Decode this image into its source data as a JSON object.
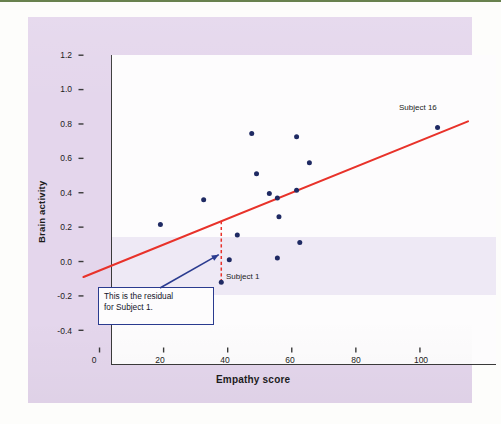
{
  "figure": {
    "background_color": "#e4d6ec",
    "plot_background_color": "#fdfcfd",
    "point_color": "#1f2a63",
    "line_color": "#e8322a",
    "annotation_color": "#2a3b8f"
  },
  "chart_data": {
    "type": "scatter",
    "title": "",
    "xlabel": "Empathy score",
    "ylabel": "Brain activity",
    "xlim": [
      -5,
      115
    ],
    "ylim": [
      -0.5,
      1.3
    ],
    "xticks": [
      0,
      20,
      40,
      60,
      80,
      100
    ],
    "yticks": [
      -0.4,
      -0.2,
      0.0,
      0.2,
      0.4,
      0.6,
      0.8,
      1.0,
      1.2
    ],
    "xtick_labels": [
      "0",
      "20",
      "40",
      "60",
      "80",
      "100"
    ],
    "ytick_labels": [
      "1.2",
      "1.0",
      "0.8",
      "0.6",
      "0.4",
      "0.2",
      "0.0",
      "-0.2",
      "-0.4"
    ],
    "grid": false,
    "legend": null,
    "points": [
      {
        "x": 38,
        "y": -0.12,
        "label": "Subject 1"
      },
      {
        "x": 19,
        "y": 0.215,
        "label": ""
      },
      {
        "x": 32.5,
        "y": 0.36,
        "label": ""
      },
      {
        "x": 40.5,
        "y": 0.01,
        "label": ""
      },
      {
        "x": 43,
        "y": 0.155,
        "label": ""
      },
      {
        "x": 47.5,
        "y": 0.745,
        "label": ""
      },
      {
        "x": 49,
        "y": 0.51,
        "label": ""
      },
      {
        "x": 53,
        "y": 0.395,
        "label": ""
      },
      {
        "x": 55.5,
        "y": 0.37,
        "label": ""
      },
      {
        "x": 55.5,
        "y": 0.02,
        "label": ""
      },
      {
        "x": 56,
        "y": 0.26,
        "label": ""
      },
      {
        "x": 61.5,
        "y": 0.415,
        "label": ""
      },
      {
        "x": 61.5,
        "y": 0.725,
        "label": ""
      },
      {
        "x": 62.5,
        "y": 0.11,
        "label": ""
      },
      {
        "x": 65.5,
        "y": 0.575,
        "label": ""
      },
      {
        "x": 105.5,
        "y": 0.78,
        "label": "Subject 16"
      }
    ],
    "regression_line": {
      "style": "solid",
      "color": "#e8322a",
      "x_start": -5,
      "y_start": -0.09,
      "x_end": 115,
      "y_end": 0.815
    },
    "residual_segment": {
      "style": "dashed",
      "color": "#e8322a",
      "x": 38,
      "y_top": 0.235,
      "y_bottom": -0.12,
      "description": "residual for Subject 1"
    },
    "point_labels": [
      {
        "text": "Subject 1",
        "x": 40,
        "y": -0.12
      },
      {
        "text": "Subject 16",
        "x": 99,
        "y": 0.9
      }
    ],
    "annotations": [
      {
        "kind": "callout-box",
        "lines": [
          "This is the residual",
          "for Subject 1."
        ],
        "arrow_to_x": 38,
        "arrow_to_y": 0.04
      }
    ]
  }
}
